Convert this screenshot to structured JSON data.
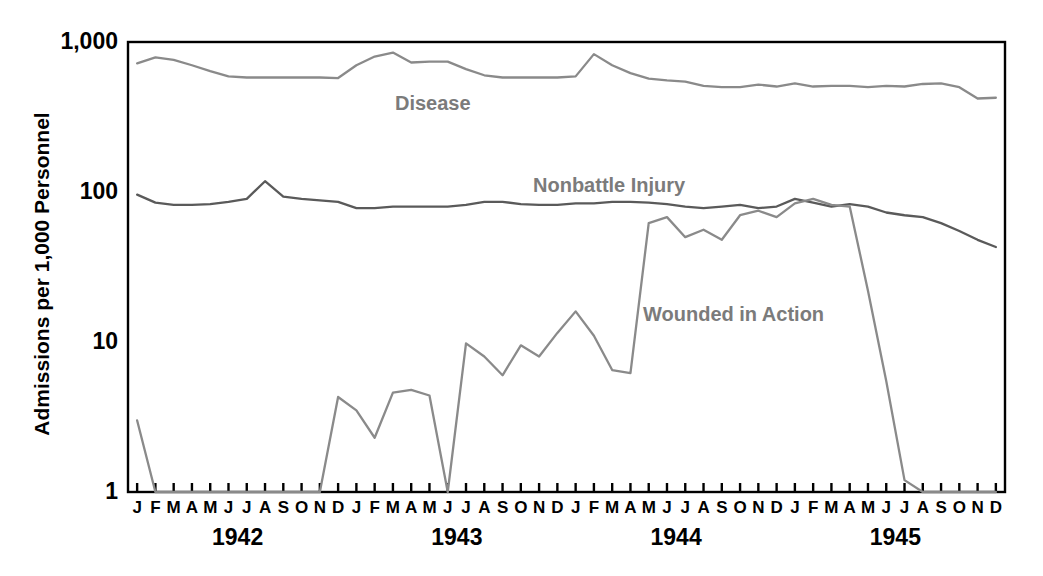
{
  "chart_data": {
    "type": "line",
    "title": "",
    "xlabel": "",
    "ylabel": "Admissions per 1,000 Personnel",
    "yscale": "log",
    "ylim": [
      1,
      1000
    ],
    "ytick_labels": [
      "1,000",
      "100",
      "10",
      "1"
    ],
    "ytick_values": [
      1000,
      100,
      10,
      1
    ],
    "grid": false,
    "legend_position": "inline-annotations",
    "month_letters": [
      "J",
      "F",
      "M",
      "A",
      "M",
      "J",
      "J",
      "A",
      "S",
      "O",
      "N",
      "D"
    ],
    "years": [
      "1942",
      "1943",
      "1944",
      "1945"
    ],
    "x": [
      "Jan 1942",
      "Feb 1942",
      "Mar 1942",
      "Apr 1942",
      "May 1942",
      "Jun 1942",
      "Jul 1942",
      "Aug 1942",
      "Sep 1942",
      "Oct 1942",
      "Nov 1942",
      "Dec 1942",
      "Jan 1943",
      "Feb 1943",
      "Mar 1943",
      "Apr 1943",
      "May 1943",
      "Jun 1943",
      "Jul 1943",
      "Aug 1943",
      "Sep 1943",
      "Oct 1943",
      "Nov 1943",
      "Dec 1943",
      "Jan 1944",
      "Feb 1944",
      "Mar 1944",
      "Apr 1944",
      "May 1944",
      "Jun 1944",
      "Jul 1944",
      "Aug 1944",
      "Sep 1944",
      "Oct 1944",
      "Nov 1944",
      "Dec 1944",
      "Jan 1945",
      "Feb 1945",
      "Mar 1945",
      "Apr 1945",
      "May 1945",
      "Jun 1945",
      "Jul 1945",
      "Aug 1945",
      "Sep 1945",
      "Oct 1945",
      "Nov 1945",
      "Dec 1945"
    ],
    "series": [
      {
        "name": "Disease",
        "color": "#8a8a8a",
        "label_x": 395,
        "label_y": 92,
        "values": [
          720,
          790,
          760,
          700,
          640,
          590,
          580,
          580,
          580,
          580,
          580,
          575,
          700,
          800,
          850,
          730,
          740,
          740,
          660,
          600,
          580,
          580,
          580,
          580,
          590,
          830,
          700,
          620,
          570,
          555,
          545,
          510,
          500,
          500,
          520,
          505,
          530,
          505,
          510,
          510,
          500,
          510,
          505,
          525,
          530,
          500,
          420,
          425
        ]
      },
      {
        "name": "Nonbattle Injury",
        "color": "#5a5a5a",
        "label_x": 533,
        "label_y": 174,
        "values": [
          96,
          85,
          82,
          82,
          83,
          86,
          90,
          118,
          93,
          90,
          88,
          86,
          78,
          78,
          80,
          80,
          80,
          80,
          82,
          86,
          86,
          83,
          82,
          82,
          84,
          84,
          86,
          86,
          85,
          83,
          80,
          78,
          80,
          82,
          78,
          80,
          90,
          85,
          80,
          83,
          80,
          73,
          70,
          68,
          62,
          55,
          48,
          43
        ]
      },
      {
        "name": "Wounded in Action",
        "color": "#8a8a8a",
        "label_x": 643,
        "label_y": 303,
        "values": [
          3.0,
          1.0,
          1.0,
          1.0,
          1.0,
          1.0,
          1.0,
          1.0,
          1.0,
          1.0,
          1.0,
          4.3,
          3.5,
          2.3,
          4.6,
          4.8,
          4.4,
          1.0,
          9.8,
          8.0,
          6.0,
          9.5,
          8.0,
          11.5,
          16.0,
          11.0,
          6.5,
          6.2,
          62.0,
          68.0,
          50.0,
          56.0,
          48.0,
          70.0,
          75.0,
          68.0,
          84.0,
          90.0,
          82.0,
          80.0,
          22.0,
          5.5,
          1.2,
          1.0,
          1.0,
          1.0,
          1.0,
          1.0
        ]
      }
    ]
  },
  "axes": {
    "plot_left": 128,
    "plot_right": 1005,
    "plot_top": 42,
    "plot_bottom": 492,
    "axis_color": "#000000"
  }
}
